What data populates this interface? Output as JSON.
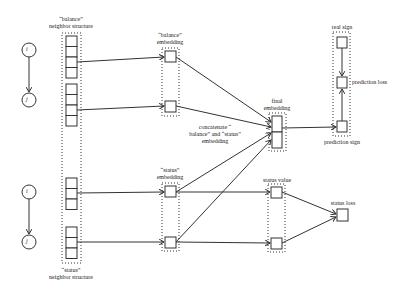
{
  "diagram": {
    "nodes": {
      "balance_i": "i",
      "balance_j": "j",
      "status_i": "i",
      "status_j": "j"
    },
    "labels": {
      "balance_neighbor_line1": "“balance”",
      "balance_neighbor_line2": "neighbor structure",
      "status_neighbor_line1": "“status”",
      "status_neighbor_line2": "neighbor structure",
      "balance_embedding_line1": "“balance”",
      "balance_embedding_line2": "embedding",
      "status_embedding_line1": "“status”",
      "status_embedding_line2": "embedding",
      "concat_line1": "concatenate “",
      "concat_line2": "balance” and “status”",
      "concat_line3": "embedding",
      "final_embedding_line1": "final",
      "final_embedding_line2": "embedding",
      "real_sign": "real sign",
      "prediction_loss": "prediction loss",
      "prediction_sign": "prediction sign",
      "status_value": "status value",
      "status_loss": "status loss"
    },
    "colors": {
      "stroke": "#333333",
      "background": "#ffffff"
    }
  }
}
